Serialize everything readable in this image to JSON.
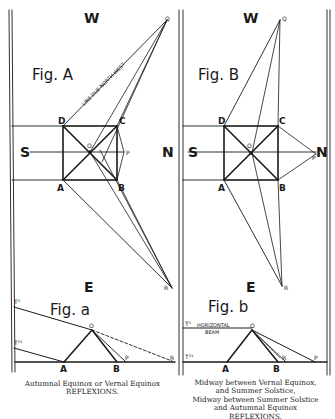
{
  "fig_a": {
    "title": "Fig. A",
    "north_west_label": "LINE DUE NORTH-WEST",
    "compass": {
      "w": "W",
      "s": "S",
      "n": "N",
      "e": "E"
    },
    "points": {
      "d": "D",
      "c": "C",
      "a": "A",
      "b": "B",
      "o": "O",
      "p": "P",
      "q": "Q",
      "r": "R"
    }
  },
  "fig_b": {
    "title": "Fig. B",
    "compass": {
      "w": "W",
      "s": "S",
      "n": "N",
      "e": "E"
    },
    "points": {
      "d": "D",
      "c": "C",
      "a": "A",
      "b": "B",
      "o": "O",
      "p": "P",
      "q": "Q",
      "r": "R"
    }
  },
  "fig_alpha": {
    "title": "Fig. a",
    "points": {
      "t1": "T¹",
      "t2": "T¹¹",
      "o": "O",
      "a": "A",
      "b": "B",
      "p": "P",
      "r": "R"
    },
    "caption": [
      "Autumnal Equinox or Vernal Equinox",
      "REFLEXIONS."
    ]
  },
  "fig_beta": {
    "title": "Fig. b",
    "horizontal_beam_label": [
      "HORIZONTAL",
      "BEAM"
    ],
    "points": {
      "t1": "T¹",
      "t2": "T¹¹",
      "o": "O",
      "a": "A",
      "b": "B",
      "p": "P",
      "r": "R"
    },
    "caption": [
      "Midway between Vernal Equinox,",
      "and Summer Solstice,",
      "Midway between Summer Solstice",
      "and Autumnal Equinox",
      "REFLEXIONS."
    ]
  },
  "colors": {
    "ink": "#1a1a1a",
    "paper": "#ffffff"
  }
}
